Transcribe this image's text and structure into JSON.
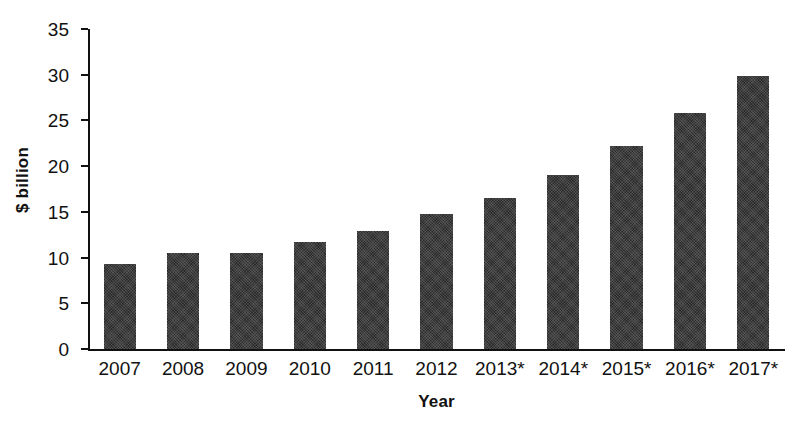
{
  "chart_data": {
    "type": "bar",
    "title": "",
    "xlabel": "Year",
    "ylabel": "$ billion",
    "categories": [
      "2007",
      "2008",
      "2009",
      "2010",
      "2011",
      "2012",
      "2013*",
      "2014*",
      "2015*",
      "2016*",
      "2017*"
    ],
    "values": [
      9.3,
      10.5,
      10.5,
      11.7,
      12.9,
      14.8,
      16.5,
      19.0,
      22.2,
      25.8,
      29.9
    ],
    "ylim": [
      0,
      35
    ],
    "yticks": [
      0,
      5,
      10,
      15,
      20,
      25,
      30,
      35
    ],
    "ytick_labels": [
      "0",
      "5",
      "10",
      "15",
      "20",
      "25",
      "30",
      "35"
    ],
    "grid": false,
    "legend": false,
    "bar_color": "#2b2b2b",
    "background_color": "#ffffff",
    "axis_color": "#111111",
    "note": "Years 2013 through 2017 are marked with an asterisk indicating forecast values."
  }
}
